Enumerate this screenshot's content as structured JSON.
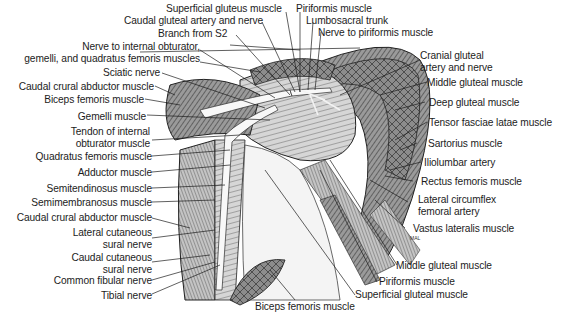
{
  "figure": {
    "type": "anatomical illustration",
    "artist_initials": "MAL"
  },
  "labels": {
    "superficial_gluteus": "Superficial gluteus muscle",
    "piriformis_top": "Piriformis muscle",
    "caudal_gluteal_artery_nerve": "Caudal gluteal artery and nerve",
    "lumbosacral_trunk": "Lumbosacral trunk",
    "branch_s2": "Branch from S2",
    "nerve_piriformis": "Nerve to piriformis muscle",
    "nerve_internal_obturator_1": "Nerve to internal obturator,",
    "nerve_internal_obturator_2": "gemelli, and quadratus femoris muscles",
    "cranial_gluteal_1": "Cranial gluteal",
    "cranial_gluteal_2": "artery and nerve",
    "sciatic_nerve": "Sciatic nerve",
    "caudal_crural_abductor_top": "Caudal crural abductor muscle",
    "middle_gluteal_top": "Middle gluteal muscle",
    "biceps_femoris_top": "Biceps femoris muscle",
    "deep_gluteal": "Deep gluteal muscle",
    "gemelli": "Gemelli muscle",
    "tensor_fasciae_latae": "Tensor fasciae latae muscle",
    "tendon_internal_obturator_1": "Tendon of internal",
    "tendon_internal_obturator_2": "obturator muscle",
    "sartorius": "Sartorius muscle",
    "quadratus_femoris": "Quadratus femoris muscle",
    "iliolumbar_artery": "Iliolumbar artery",
    "adductor": "Adductor muscle",
    "rectus_femoris": "Rectus femoris muscle",
    "semitendinosus": "Semitendinosus muscle",
    "lateral_circumflex_1": "Lateral circumflex",
    "lateral_circumflex_2": "femoral artery",
    "semimembranosus": "Semimembranosus muscle",
    "caudal_crural_abductor_bottom": "Caudal crural abductor muscle",
    "vastus_lateralis": "Vastus lateralis muscle",
    "lateral_cutaneous_sural_1": "Lateral cutaneous",
    "lateral_cutaneous_sural_2": "sural nerve",
    "caudal_cutaneous_sural_1": "Caudal cutaneous",
    "caudal_cutaneous_sural_2": "sural nerve",
    "middle_gluteal_bottom": "Middle gluteal muscle",
    "common_fibular": "Common fibular nerve",
    "piriformis_bottom": "Piriformis muscle",
    "tibial_nerve": "Tibial nerve",
    "superficial_gluteal_bottom": "Superficial gluteal muscle",
    "biceps_femoris_bottom": "Biceps femoris muscle"
  },
  "colors": {
    "ink": "#1c1c1c",
    "muscle_shade": "#6e6e6e",
    "muscle_light": "#b8b8b8",
    "nerve": "#f4f4f4",
    "background": "#ffffff"
  }
}
